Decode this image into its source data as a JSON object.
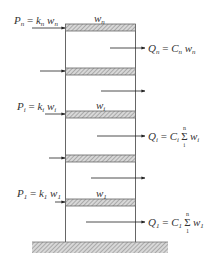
{
  "diagram": {
    "type": "structural-frame-lateral-loads",
    "colors": {
      "line": "#555555",
      "hatch": "#888888",
      "text": "#333333"
    },
    "floors": [
      {
        "id": "n",
        "weight_label": {
          "base": "w",
          "sub": "n"
        },
        "applied_load_label": {
          "lhs": "P",
          "lhs_sub": "n",
          "eq": " = ",
          "coef": "k",
          "coef_sub": "n",
          "var": " w",
          "var_sub": "n"
        },
        "shear_label": {
          "lhs": "Q",
          "lhs_sub": "n",
          "eq": " = ",
          "coef": "C",
          "coef_sub": "n",
          "var": " w",
          "var_sub": "n"
        }
      },
      {
        "id": "i",
        "weight_label": {
          "base": "w",
          "sub": "i"
        },
        "applied_load_label": {
          "lhs": "P",
          "lhs_sub": "i",
          "eq": " = ",
          "coef": "k",
          "coef_sub": "i",
          "var": " w",
          "var_sub": "i"
        },
        "shear_label": {
          "lhs": "Q",
          "lhs_sub": "i",
          "eq": " = ",
          "coef": "C",
          "coef_sub": "i",
          "sum_top": "n",
          "sum_bot": "i",
          "var": "w",
          "var_sub": "i"
        }
      },
      {
        "id": "1",
        "weight_label": {
          "base": "w",
          "sub": "1"
        },
        "applied_load_label": {
          "lhs": "P",
          "lhs_sub": "1",
          "eq": " = ",
          "coef": "k",
          "coef_sub": "1",
          "var": " w",
          "var_sub": "1"
        },
        "shear_label": {
          "lhs": "Q",
          "lhs_sub": "1",
          "eq": " = ",
          "coef": "C",
          "coef_sub": "1",
          "sum_top": "n",
          "sum_bot": "1",
          "var": "w",
          "var_sub": "1"
        }
      }
    ],
    "sum_symbol": "Σ"
  }
}
